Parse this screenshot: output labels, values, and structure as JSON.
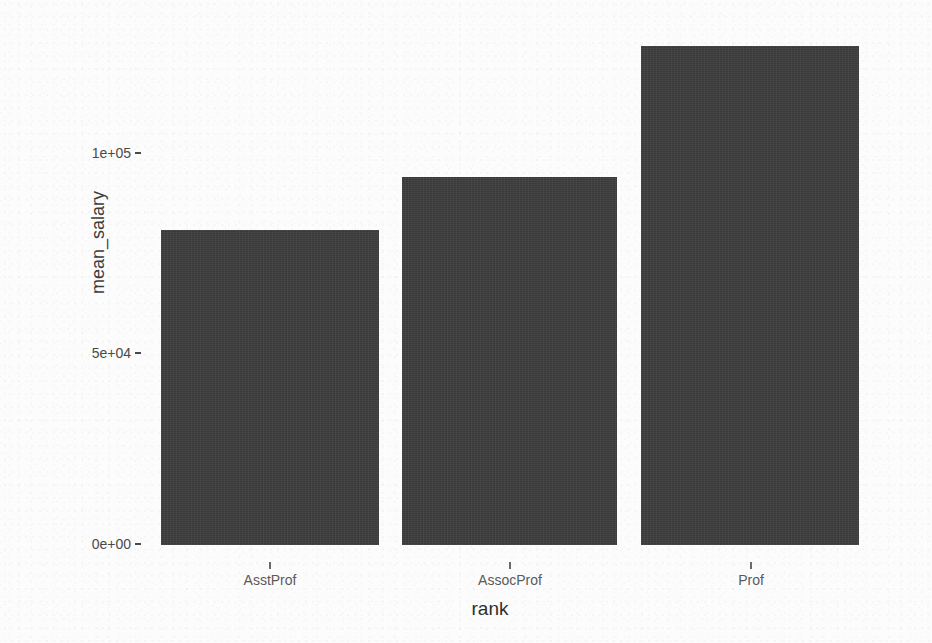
{
  "chart_data": {
    "type": "bar",
    "title": "",
    "subtitle": "",
    "xlabel": "rank",
    "ylabel": "mean_salary",
    "categories": [
      "AsstProf",
      "AssocProf",
      "Prof"
    ],
    "values": [
      80600,
      94100,
      127600
    ],
    "series": [
      {
        "name": "mean_salary",
        "values": [
          80600,
          94100,
          127600
        ]
      }
    ],
    "ylim": [
      0,
      130000
    ],
    "ytick_labels": [
      "0e+00",
      "5e+04",
      "1e+05"
    ],
    "ytick_values": [
      0,
      50000,
      100000
    ],
    "xtick_labels": [
      "AsstProf",
      "AssocProf",
      "Prof"
    ],
    "grid": false,
    "legend": "none",
    "bar_color": "#3d3d3d",
    "background_color": "#fcfcfc",
    "axis_text_color": "#4a4a4a"
  },
  "axes": {
    "y_title": "mean_salary",
    "x_title": "rank",
    "y_ticks": [
      {
        "label": "0e+00",
        "value": 0
      },
      {
        "label": "5e+04",
        "value": 50000
      },
      {
        "label": "1e+05",
        "value": 100000
      }
    ],
    "x_ticks": [
      {
        "label": "AsstProf",
        "value": 80600
      },
      {
        "label": "AssocProf",
        "value": 94100
      },
      {
        "label": "Prof",
        "value": 127600
      }
    ]
  },
  "bars": [
    {
      "category": "AsstProf",
      "value": 80600
    },
    {
      "category": "AssocProf",
      "value": 94100
    },
    {
      "category": "Prof",
      "value": 127600
    }
  ]
}
